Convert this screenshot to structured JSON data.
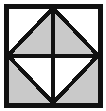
{
  "figure": {
    "canvas": {
      "width": 106,
      "height": 111,
      "background": "#ffffff"
    },
    "geometry": {
      "outer_square": {
        "x": 6,
        "y": 6,
        "width": 94,
        "height": 99
      },
      "stroke_color": "#111111",
      "outer_stroke_width": 5,
      "inner_stroke_width": 4,
      "vertices": {
        "top_left": [
          8,
          8
        ],
        "top_right": [
          98,
          8
        ],
        "bottom_right": [
          98,
          103
        ],
        "bottom_left": [
          8,
          103
        ],
        "top_mid": [
          53,
          8
        ],
        "right_mid": [
          98,
          55.5
        ],
        "bottom_mid": [
          53,
          103
        ],
        "left_mid": [
          8,
          55.5
        ],
        "centre": [
          53,
          55.5
        ]
      }
    },
    "fills": {
      "shaded": "#c9c9c9",
      "unshaded": "#ffffff"
    },
    "regions": [
      {
        "name": "outer-corner-top-left",
        "shade": "unshaded",
        "points": "8,8 53,8 8,55.5"
      },
      {
        "name": "outer-corner-top-right",
        "shade": "unshaded",
        "points": "53,8 98,8 98,55.5"
      },
      {
        "name": "outer-corner-bottom-right",
        "shade": "shaded",
        "points": "98,55.5 98,103 53,103"
      },
      {
        "name": "outer-corner-bottom-left",
        "shade": "shaded",
        "points": "8,55.5 53,103 8,103"
      },
      {
        "name": "diamond-upper-left",
        "shade": "shaded",
        "points": "53,8 53,55.5 8,55.5"
      },
      {
        "name": "diamond-upper-right",
        "shade": "shaded",
        "points": "53,8 98,55.5 53,55.5"
      },
      {
        "name": "diamond-lower-right",
        "shade": "unshaded",
        "points": "53,55.5 98,55.5 53,103"
      },
      {
        "name": "diamond-lower-left",
        "shade": "unshaded",
        "points": "53,55.5 53,103 8,55.5"
      }
    ],
    "lines": [
      {
        "name": "diamond-edge-top-left",
        "x1": 53,
        "y1": 8,
        "x2": 8,
        "y2": 55.5
      },
      {
        "name": "diamond-edge-top-right",
        "x1": 53,
        "y1": 8,
        "x2": 98,
        "y2": 55.5
      },
      {
        "name": "diamond-edge-bottom-right",
        "x1": 98,
        "y1": 55.5,
        "x2": 53,
        "y2": 103
      },
      {
        "name": "diamond-edge-bottom-left",
        "x1": 53,
        "y1": 103,
        "x2": 8,
        "y2": 55.5
      },
      {
        "name": "centre-line-horizontal",
        "x1": 8,
        "y1": 55.5,
        "x2": 98,
        "y2": 55.5
      },
      {
        "name": "centre-line-vertical",
        "x1": 53,
        "y1": 8,
        "x2": 53,
        "y2": 103
      }
    ]
  }
}
